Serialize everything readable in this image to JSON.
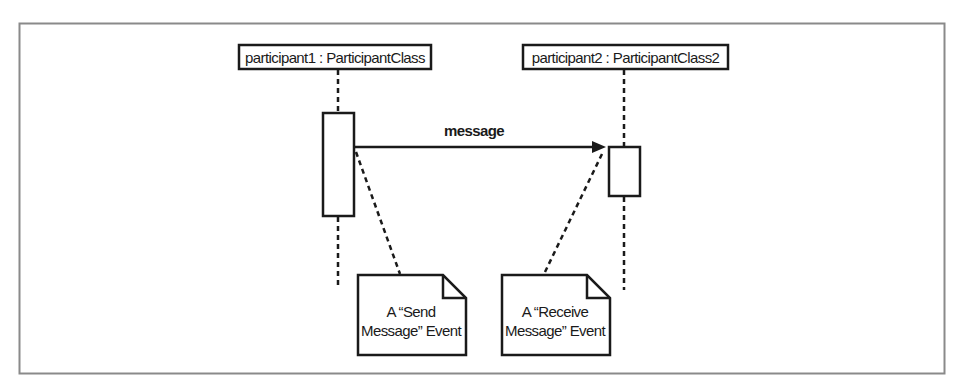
{
  "diagram": {
    "type": "uml-sequence",
    "frame": {
      "x": 19,
      "y": 23,
      "width": 925,
      "height": 350,
      "color": "#888888"
    },
    "participants": [
      {
        "id": "p1",
        "label": "participant1 : ParticipantClass",
        "box": {
          "x": 239,
          "y": 45,
          "width": 192,
          "height": 24
        },
        "lifeline_x": 338
      },
      {
        "id": "p2",
        "label": "participant2 : ParticipantClass2",
        "box": {
          "x": 523,
          "y": 45,
          "width": 205,
          "height": 24
        },
        "lifeline_x": 624
      }
    ],
    "activations": [
      {
        "participant": "p1",
        "x": 323,
        "y": 113,
        "width": 31,
        "height": 103
      },
      {
        "participant": "p2",
        "x": 609,
        "y": 147,
        "width": 31,
        "height": 49
      }
    ],
    "messages": [
      {
        "from": "p1",
        "to": "p2",
        "label": "message",
        "y": 147,
        "arrow": "synchronous-filled"
      }
    ],
    "notes": [
      {
        "id": "send-event-note",
        "lines": [
          "A “Send",
          "Message” Event"
        ],
        "x": 358,
        "y": 275,
        "width": 108,
        "height": 80,
        "anchor_to": "message-start"
      },
      {
        "id": "receive-event-note",
        "lines": [
          "A “Receive",
          "Message” Event"
        ],
        "x": 502,
        "y": 275,
        "width": 108,
        "height": 80,
        "anchor_to": "message-end"
      }
    ],
    "colors": {
      "stroke": "#1a1a1a",
      "frame": "#8a8a8a",
      "background": "#ffffff"
    }
  }
}
